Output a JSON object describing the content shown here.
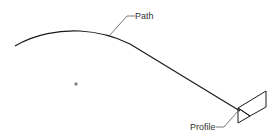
{
  "diagram": {
    "type": "sweep-illustration",
    "labels": {
      "path": "Path",
      "profile": "Profile"
    },
    "colors": {
      "background": "#ffffff",
      "stroke": "#1a1a1a",
      "leader": "#555555",
      "text": "#333333"
    },
    "elements": [
      {
        "name": "path-curve",
        "description": "Curved sweep path rising then descending to the profile"
      },
      {
        "name": "profile-shape",
        "description": "Planar profile (parallelogram with triangle) at end of path"
      },
      {
        "name": "origin-marker",
        "description": "Small plus-sign cursor/origin marker"
      }
    ]
  }
}
